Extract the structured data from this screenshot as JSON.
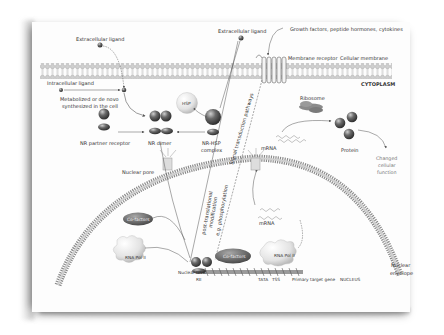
{
  "diagram": {
    "type": "nuclear-receptor-signaling-pathway",
    "labels": {
      "extracellular_ligand_left": "Extracellular ligand",
      "extracellular_ligand_center": "Extracellular ligand",
      "growth_factors": "Growth factors, peptide hormones, cytokines",
      "membrane_receptor": "Membrane receptor",
      "cellular_membrane": "Cellular membrane",
      "cytoplasm": "CYTOPLASM",
      "intracellular_ligand": "Intracellular ligand",
      "metabolized_line1": "Metabolized or de novo",
      "metabolized_line2": "synthesized in the cell",
      "hsp": "HSP",
      "nr_partner_receptor": "NR partner receptor",
      "nr_dimer": "NR dimer",
      "nr_hsp_line1": "NR-HSP",
      "nr_hsp_line2": "complex",
      "signal_transduction": "Signal transduction pathways",
      "ribosome": "Ribosome",
      "mrna_cytoplasm": "mRNA",
      "protein": "Protein",
      "changed_line1": "Changed",
      "changed_line2": "cellular",
      "changed_line3": "function",
      "nuclear_pore": "Nuclear pore",
      "ptm_line1": "post-translational",
      "ptm_line2": "modification",
      "ptm_line3": "e.g. phosphorylation",
      "mrna_nucleus": "mRNA",
      "cofactors_left": "Co-factors",
      "cofactors_dna": "Co-factors",
      "rna_pol_left": "RNA Pol II",
      "rna_pol_dna": "RNA Pol II",
      "nuclear_dna": "Nuclear DNA",
      "re": "RE",
      "tata": "TATA",
      "tss": "TSS",
      "primary_target_gene": "Primary target gene",
      "nucleus": "NUCLEUS",
      "nuclear_envelope_line1": "Nuclear",
      "nuclear_envelope_line2": "envelope"
    },
    "colors": {
      "background": "#fdfdfd",
      "membrane": "#b5b5b5",
      "sphere_dark": "#555555",
      "cofactor": "#666666",
      "cloud": "#e2e2e2",
      "text": "#333333"
    }
  }
}
